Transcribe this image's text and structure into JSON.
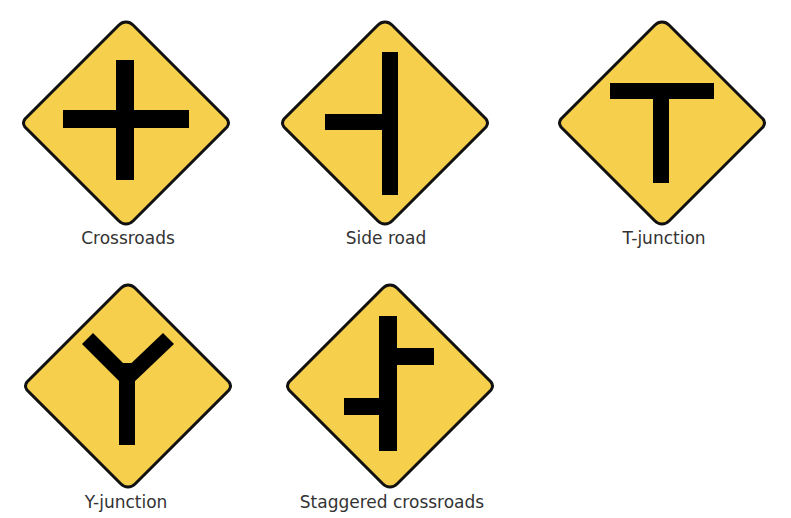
{
  "colors": {
    "sign_fill": "#F6D04D",
    "symbol": "#000000",
    "border": "#111111",
    "caption_text": "#333333",
    "background": "#FFFFFF"
  },
  "signs": [
    {
      "name": "crossroads",
      "label": "Crossroads",
      "icon": "crossroads-icon"
    },
    {
      "name": "side-road",
      "label": "Side road",
      "icon": "side-road-icon"
    },
    {
      "name": "t-junction",
      "label": "T-junction",
      "icon": "t-junction-icon"
    },
    {
      "name": "y-junction",
      "label": "Y-junction",
      "icon": "y-junction-icon"
    },
    {
      "name": "staggered-crossroads",
      "label": "Staggered crossroads",
      "icon": "staggered-crossroads-icon"
    }
  ]
}
